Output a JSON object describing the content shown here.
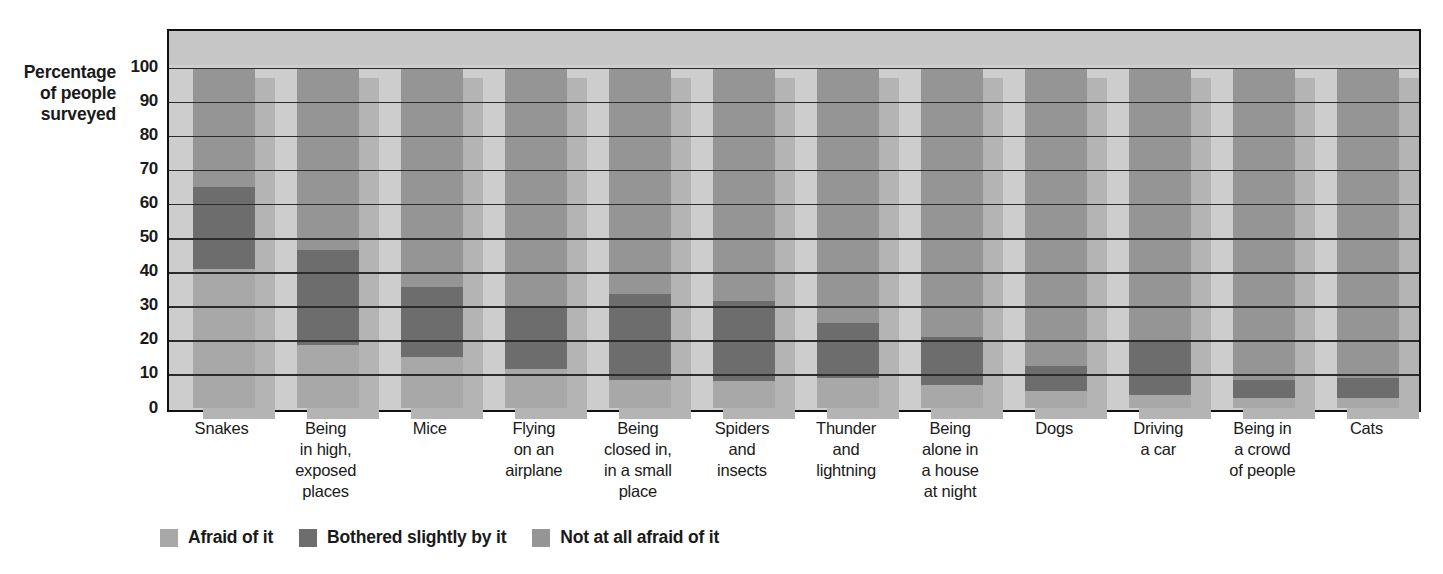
{
  "axis_title": "Percentage of people surveyed",
  "axis_title_lines": [
    "Percentage",
    "of people",
    "surveyed"
  ],
  "legend": [
    {
      "label": "Afraid of it",
      "color": "#a8a8a8",
      "key": "afraid"
    },
    {
      "label": "Bothered slightly by it",
      "color": "#6d6d6d",
      "key": "bothered"
    },
    {
      "label": "Not at all afraid of it",
      "color": "#959595",
      "key": "notatall"
    }
  ],
  "chart_data": {
    "type": "bar",
    "subtype": "stacked-percentage",
    "title": "",
    "xlabel": "",
    "ylabel": "Percentage of people surveyed",
    "ylim": [
      0,
      100
    ],
    "yticks": [
      0,
      10,
      20,
      30,
      40,
      50,
      60,
      70,
      80,
      90,
      100
    ],
    "grid": true,
    "legend_position": "bottom-left",
    "categories": [
      "Snakes",
      "Being in high, exposed places",
      "Mice",
      "Flying on an airplane",
      "Being closed in, in a small place",
      "Spiders and insects",
      "Thunder and lightning",
      "Being alone in a house at night",
      "Dogs",
      "Driving a car",
      "Being in a crowd of people",
      "Cats"
    ],
    "category_lines": [
      [
        "Snakes"
      ],
      [
        "Being",
        "in high,",
        "exposed",
        "places"
      ],
      [
        "Mice"
      ],
      [
        "Flying",
        "on an",
        "airplane"
      ],
      [
        "Being",
        "closed in,",
        "in a small",
        "place"
      ],
      [
        "Spiders",
        "and",
        "insects"
      ],
      [
        "Thunder",
        "and",
        "lightning"
      ],
      [
        "Being",
        "alone in",
        "a house",
        "at night"
      ],
      [
        "Dogs"
      ],
      [
        "Driving",
        "a car"
      ],
      [
        "Being in",
        "a crowd",
        "of people"
      ],
      [
        "Cats"
      ]
    ],
    "series": [
      {
        "name": "Afraid of it",
        "color": "#a8a8a8",
        "values": [
          41,
          18.5,
          15,
          11.5,
          8.5,
          8,
          9,
          7,
          5,
          4,
          3,
          3
        ]
      },
      {
        "name": "Bothered slightly by it",
        "color": "#6d6d6d",
        "values": [
          24,
          28,
          20.5,
          18.5,
          25,
          23.5,
          16,
          14,
          7.5,
          15.5,
          5.5,
          6
        ]
      },
      {
        "name": "Not at all afraid of it",
        "color": "#959595",
        "values": [
          35,
          53.5,
          64.5,
          70,
          66.5,
          68.5,
          75,
          79,
          87.5,
          80.5,
          91.5,
          91
        ]
      }
    ]
  }
}
